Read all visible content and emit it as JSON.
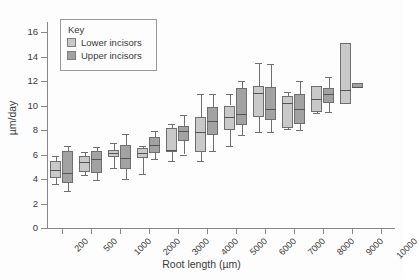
{
  "chart_data": {
    "type": "box",
    "title": "",
    "xlabel": "Root length (µm)",
    "ylabel": "µm/day",
    "ylim": [
      0,
      17
    ],
    "yticks": [
      0,
      2,
      4,
      6,
      8,
      10,
      12,
      14,
      16
    ],
    "ytick_labels": [
      "0",
      "2",
      "4",
      "6",
      "8",
      "10",
      "12",
      "14",
      "16"
    ],
    "grid": false,
    "legend": {
      "title": "Key",
      "position": "upper-left-inside",
      "entries": [
        {
          "name": "Lower incisors",
          "color": "#c9c9c9"
        },
        {
          "name": "Upper incisors",
          "color": "#a2a2a2"
        }
      ]
    },
    "categories": [
      "200",
      "500",
      "1000",
      "2000",
      "3000",
      "4000",
      "5000",
      "6000",
      "7000",
      "8000",
      "9000",
      "10000"
    ],
    "series": [
      {
        "name": "Lower incisors",
        "color": "#c9c9c9",
        "boxes": [
          {
            "category": "200",
            "whisker_low": 3.6,
            "q1": 4.1,
            "median": 4.7,
            "q3": 5.5,
            "whisker_high": 5.9
          },
          {
            "category": "500",
            "whisker_low": 4.3,
            "q1": 4.6,
            "median": 5.4,
            "q3": 5.9,
            "whisker_high": 6.2
          },
          {
            "category": "1000",
            "whisker_low": 4.9,
            "q1": 5.8,
            "median": 6.1,
            "q3": 6.4,
            "whisker_high": 6.9
          },
          {
            "category": "2000",
            "whisker_low": 4.4,
            "q1": 5.7,
            "median": 6.1,
            "q3": 6.5,
            "whisker_high": 6.7
          },
          {
            "category": "3000",
            "whisker_low": 5.5,
            "q1": 6.2,
            "median": 6.4,
            "q3": 8.2,
            "whisker_high": 8.5
          },
          {
            "category": "4000",
            "whisker_low": 5.5,
            "q1": 6.2,
            "median": 7.8,
            "q3": 9.1,
            "whisker_high": 10.9
          },
          {
            "category": "5000",
            "whisker_low": 6.7,
            "q1": 8.0,
            "median": 9.1,
            "q3": 10.0,
            "whisker_high": 10.9
          },
          {
            "category": "6000",
            "whisker_low": 7.8,
            "q1": 9.1,
            "median": 11.0,
            "q3": 11.6,
            "whisker_high": 13.5
          },
          {
            "category": "7000",
            "whisker_low": 8.1,
            "q1": 8.2,
            "median": 10.2,
            "q3": 10.8,
            "whisker_high": 11.1
          },
          {
            "category": "8000",
            "whisker_low": 9.4,
            "q1": 9.5,
            "median": 10.5,
            "q3": 11.6,
            "whisker_high": 11.6
          },
          {
            "category": "9000",
            "whisker_low": 10.1,
            "q1": 10.1,
            "median": 11.3,
            "q3": 15.1,
            "whisker_high": 15.1
          },
          {
            "category": "10000",
            "whisker_low": null,
            "q1": null,
            "median": null,
            "q3": null,
            "whisker_high": null
          }
        ]
      },
      {
        "name": "Upper incisors",
        "color": "#a2a2a2",
        "boxes": [
          {
            "category": "200",
            "whisker_low": 3.0,
            "q1": 3.7,
            "median": 4.5,
            "q3": 6.3,
            "whisker_high": 6.7
          },
          {
            "category": "500",
            "whisker_low": 3.9,
            "q1": 4.5,
            "median": 5.6,
            "q3": 6.3,
            "whisker_high": 6.6
          },
          {
            "category": "1000",
            "whisker_low": 4.0,
            "q1": 4.8,
            "median": 5.7,
            "q3": 6.8,
            "whisker_high": 7.7
          },
          {
            "category": "2000",
            "whisker_low": 5.6,
            "q1": 6.1,
            "median": 6.8,
            "q3": 7.4,
            "whisker_high": 7.9
          },
          {
            "category": "3000",
            "whisker_low": 6.0,
            "q1": 7.1,
            "median": 7.9,
            "q3": 8.3,
            "whisker_high": 9.2
          },
          {
            "category": "4000",
            "whisker_low": 6.3,
            "q1": 7.6,
            "median": 8.7,
            "q3": 9.9,
            "whisker_high": 10.9
          },
          {
            "category": "5000",
            "whisker_low": 7.6,
            "q1": 8.4,
            "median": 9.3,
            "q3": 11.4,
            "whisker_high": 12.0
          },
          {
            "category": "6000",
            "whisker_low": 7.8,
            "q1": 8.8,
            "median": 9.7,
            "q3": 11.5,
            "whisker_high": 13.4
          },
          {
            "category": "7000",
            "whisker_low": 8.0,
            "q1": 8.5,
            "median": 9.7,
            "q3": 10.9,
            "whisker_high": 12.0
          },
          {
            "category": "8000",
            "whisker_low": 9.5,
            "q1": 10.2,
            "median": 10.9,
            "q3": 11.4,
            "whisker_high": 12.3
          },
          {
            "category": "9000",
            "whisker_low": 11.4,
            "q1": 11.4,
            "median": 11.5,
            "q3": 11.8,
            "whisker_high": 11.8
          },
          {
            "category": "10000",
            "whisker_low": null,
            "q1": null,
            "median": null,
            "q3": null,
            "whisker_high": null
          }
        ]
      }
    ]
  }
}
